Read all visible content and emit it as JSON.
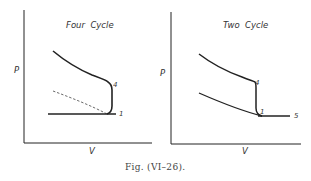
{
  "figure": {
    "caption": "Fig. (VI–26)."
  },
  "diagrams": [
    {
      "title": "Four  Cycle",
      "y_axis_label": "P",
      "x_axis_label": "V",
      "point_labels": [
        "4",
        "1"
      ],
      "curves": [
        {
          "name": "expansion-curve",
          "style": "solid"
        },
        {
          "name": "blowdown-vertical",
          "style": "solid"
        },
        {
          "name": "compression-curve",
          "style": "dashed"
        },
        {
          "name": "exhaust-line",
          "style": "solid"
        }
      ]
    },
    {
      "title": "Two  Cycle",
      "y_axis_label": "P",
      "x_axis_label": "V",
      "point_labels": [
        "4",
        "1",
        "5"
      ],
      "curves": [
        {
          "name": "expansion-curve",
          "style": "solid"
        },
        {
          "name": "blowdown-vertical",
          "style": "solid"
        },
        {
          "name": "compression-curve",
          "style": "solid"
        },
        {
          "name": "scavenge-line",
          "style": "solid"
        }
      ]
    }
  ]
}
